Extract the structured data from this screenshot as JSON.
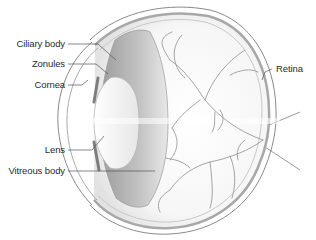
{
  "diagram": {
    "labels": {
      "ciliary_body": "Ciliary body",
      "zonules": "Zonules",
      "cornea": "Cornea",
      "lens": "Lens",
      "vitreous_body": "Vitreous body",
      "retina": "Retina"
    },
    "colors": {
      "background": "#ffffff",
      "outline": "#8a8a8a",
      "vessel": "#9a9a9a",
      "ciliary_shade": "#a8a8a8",
      "lens_fill": "#f4f4f4",
      "text": "#2a2a2a"
    }
  }
}
